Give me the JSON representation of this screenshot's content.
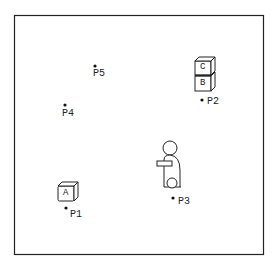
{
  "diagram": {
    "type": "blocks-world scene",
    "frame": {
      "x": 14,
      "y": 15,
      "width": 250,
      "height": 240
    },
    "points": [
      {
        "id": "P1",
        "label": "P1",
        "x": 66,
        "y": 208
      },
      {
        "id": "P2",
        "label": "P2",
        "x": 202,
        "y": 100
      },
      {
        "id": "P3",
        "label": "P3",
        "x": 173,
        "y": 197
      },
      {
        "id": "P4",
        "label": "P4",
        "x": 65,
        "y": 105
      },
      {
        "id": "P5",
        "label": "P5",
        "x": 95,
        "y": 66
      }
    ],
    "blocks": [
      {
        "id": "A",
        "label": "A",
        "location": "above P1"
      },
      {
        "id": "B",
        "label": "B",
        "location": "above P2, bottom of stack"
      },
      {
        "id": "C",
        "label": "C",
        "location": "on top of B"
      }
    ],
    "robot": {
      "description": "robot figure with head, arm and wheel",
      "location": "above P3"
    }
  },
  "labels": {
    "p1": "P1",
    "p2": "P2",
    "p3": "P3",
    "p4": "P4",
    "p5": "P5",
    "a": "A",
    "b": "B",
    "c": "C"
  }
}
